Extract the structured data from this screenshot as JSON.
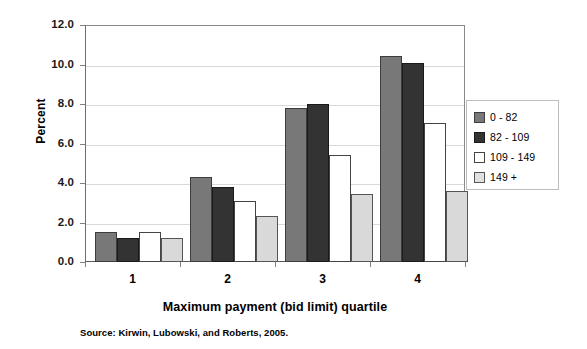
{
  "chart_data": {
    "type": "bar",
    "title": "",
    "subtitle": "",
    "xlabel": "Maximum payment (bid limit) quartile",
    "ylabel": "Percent",
    "categories": [
      "1",
      "2",
      "3",
      "4"
    ],
    "series": [
      {
        "name": "0 - 82",
        "color": "#787878",
        "values": [
          1.5,
          4.3,
          7.8,
          10.45
        ]
      },
      {
        "name": "82 - 109",
        "color": "#333333",
        "values": [
          1.2,
          3.8,
          8.0,
          10.1
        ]
      },
      {
        "name": "109 - 149",
        "color": "#ffffff",
        "values": [
          1.5,
          3.1,
          5.4,
          7.05
        ]
      },
      {
        "name": "149 +",
        "color": "#d9d9d9",
        "values": [
          1.2,
          2.35,
          3.45,
          3.6
        ]
      }
    ],
    "ylim": [
      0.0,
      12.0
    ],
    "ytick_labels": [
      "0.0",
      "2.0",
      "4.0",
      "6.0",
      "8.0",
      "10.0",
      "12.0"
    ],
    "ytick_values": [
      0.0,
      2.0,
      4.0,
      6.0,
      8.0,
      10.0,
      12.0
    ],
    "grid": true,
    "grid_axis": "y",
    "legend_position": "right",
    "bar_orientation": "vertical"
  },
  "source_note": "Source: Kirwin, Lubowski, and Roberts, 2005."
}
